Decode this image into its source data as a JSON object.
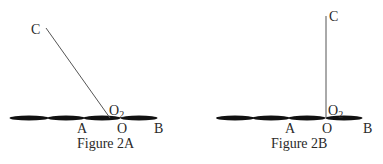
{
  "figures": [
    {
      "id": "2A",
      "caption": "Figure 2A",
      "labels": {
        "C": "C",
        "O2": "O",
        "O2_sub": "2",
        "A": "A",
        "O": "O",
        "B": "B"
      },
      "rod": "inclined"
    },
    {
      "id": "2B",
      "caption": "Figure 2B",
      "labels": {
        "C": "C",
        "O2": "O",
        "O2_sub": "2",
        "A": "A",
        "O": "O",
        "B": "B"
      },
      "rod": "vertical"
    }
  ],
  "colors": {
    "chain": "#111111",
    "rod": "#555555",
    "text": "#2a2a2a"
  }
}
